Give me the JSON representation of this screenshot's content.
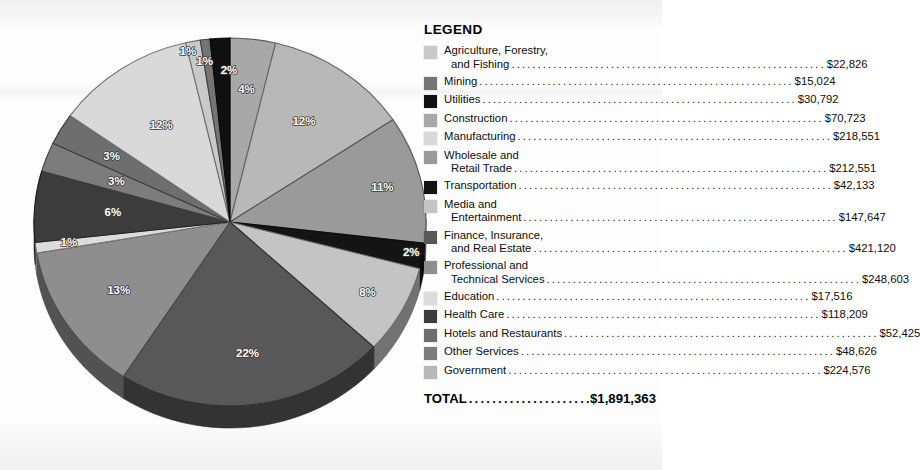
{
  "legend": {
    "title": "LEGEND",
    "total_label": "TOTAL",
    "total_value": "$1,891,363",
    "items": [
      {
        "line1": "Agriculture, Forestry,",
        "line2": "and Fishing",
        "label": "Agriculture, Forestry, and Fishing",
        "value": "$22,826",
        "color": "#c9c9c9",
        "percent": "1%"
      },
      {
        "line1": "Mining",
        "line2": "",
        "label": "Mining",
        "value": "$15,024",
        "color": "#757575",
        "percent": "1%"
      },
      {
        "line1": "Utilities",
        "line2": "",
        "label": "Utilities",
        "value": "$30,792",
        "color": "#101010",
        "percent": "2%"
      },
      {
        "line1": "Construction",
        "line2": "",
        "label": "Construction",
        "value": "$70,723",
        "color": "#a8a8a8",
        "percent": "4%"
      },
      {
        "line1": "Manufacturing",
        "line2": "",
        "label": "Manufacturing",
        "value": "$218,551",
        "color": "#d9d9d9",
        "percent": "12%"
      },
      {
        "line1": "Wholesale and",
        "line2": "Retail Trade",
        "label": "Wholesale and Retail Trade",
        "value": "$212,551",
        "color": "#9a9a9a",
        "percent": "11%"
      },
      {
        "line1": "Transportation",
        "line2": "",
        "label": "Transportation",
        "value": "$42,133",
        "color": "#141414",
        "percent": "2%"
      },
      {
        "line1": "Media and",
        "line2": "Entertainment",
        "label": "Media and Entertainment",
        "value": "$147,647",
        "color": "#c4c4c4",
        "percent": "8%"
      },
      {
        "line1": "Finance, Insurance,",
        "line2": "and Real Estate",
        "label": "Finance, Insurance, and Real Estate",
        "value": "$421,120",
        "color": "#585858",
        "percent": "22%"
      },
      {
        "line1": "Professional and",
        "line2": "Technical Services",
        "label": "Professional and Technical Services",
        "value": "$248,603",
        "color": "#8e8e8e",
        "percent": "13%"
      },
      {
        "line1": "Education",
        "line2": "",
        "label": "Education",
        "value": "$17,516",
        "color": "#dcdcdc",
        "percent": "1%"
      },
      {
        "line1": "Health Care",
        "line2": "",
        "label": "Health Care",
        "value": "$118,209",
        "color": "#3c3c3c",
        "percent": "6%"
      },
      {
        "line1": "Hotels and Restaurants",
        "line2": "",
        "label": "Hotels and Restaurants",
        "value": "$52,425",
        "color": "#6e6e6e",
        "percent": "3%"
      },
      {
        "line1": "Other Services",
        "line2": "",
        "label": "Other Services",
        "value": "$48,626",
        "color": "#7c7c7c",
        "percent": "3%"
      },
      {
        "line1": "Government",
        "line2": "",
        "label": "Government",
        "value": "$224,576",
        "color": "#b8b8b8",
        "percent": "12%"
      }
    ]
  },
  "chart_data": {
    "type": "pie",
    "title": "",
    "value_unit": "USD",
    "total": 1891363,
    "total_formatted": "$1,891,363",
    "start_angle_deg": -90,
    "direction": "clockwise",
    "three_d": true,
    "categories": [
      "Construction",
      "Government",
      "Wholesale and Retail Trade",
      "Transportation",
      "Media and Entertainment",
      "Finance, Insurance, and Real Estate",
      "Professional and Technical Services",
      "Education",
      "Health Care",
      "Other Services",
      "Hotels and Restaurants",
      "Manufacturing",
      "Agriculture, Forestry, and Fishing",
      "Mining",
      "Utilities"
    ],
    "values": [
      70723,
      224576,
      212551,
      42133,
      147647,
      421120,
      248603,
      17516,
      118209,
      48626,
      52425,
      218551,
      22826,
      15024,
      30792
    ],
    "percent_labels": [
      "4%",
      "12%",
      "11%",
      "2%",
      "8%",
      "22%",
      "13%",
      "1%",
      "6%",
      "3%",
      "3%",
      "12%",
      "1%",
      "1%",
      "2%"
    ],
    "colors": [
      "#a8a8a8",
      "#b8b8b8",
      "#9a9a9a",
      "#141414",
      "#c4c4c4",
      "#585858",
      "#8e8e8e",
      "#dcdcdc",
      "#3c3c3c",
      "#7c7c7c",
      "#6e6e6e",
      "#d9d9d9",
      "#c9c9c9",
      "#757575",
      "#101010"
    ],
    "legend_position": "right",
    "grid": false
  }
}
